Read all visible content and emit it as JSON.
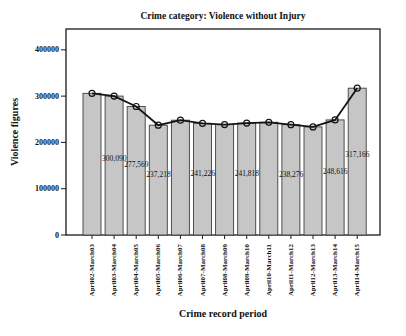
{
  "figure": {
    "title": "Crime category: Violence without Injury"
  },
  "chart_data": {
    "type": "bar",
    "overlay": "line",
    "title": "Crime category: Violence without Injury",
    "xlabel": "Crime record period",
    "ylabel": "Violence figures",
    "categories": [
      "April02-March03",
      "April03-March04",
      "April04-March05",
      "April05-March06",
      "April06-March07",
      "April07-March08",
      "April08-March09",
      "April09-March10",
      "April10-March11",
      "April11-March12",
      "April12-March13",
      "April13-March14",
      "April14-March15"
    ],
    "values": [
      306000,
      300090,
      277569,
      237218,
      248000,
      241226,
      238500,
      241818,
      243500,
      238276,
      233500,
      248616,
      317166
    ],
    "value_labels": [
      "",
      "300,090",
      "277,569",
      "237,218",
      "",
      "241,226",
      "",
      "241,818",
      "",
      "238,276",
      "",
      "248,616",
      "317,166"
    ],
    "y_ticks": [
      "0",
      "100000",
      "200000",
      "300000",
      "400000"
    ],
    "y_tick_values": [
      0,
      100000,
      200000,
      300000,
      400000
    ],
    "ylim": [
      0,
      445000
    ],
    "grid": false,
    "legend": "none",
    "colors": {
      "bar_fill": "#c6c6c6",
      "bar_border": "#3f3f3f",
      "line": "#141414",
      "marker_stroke": "#141414",
      "frame": "#1a1a1a",
      "text": "#111111"
    },
    "marker": "open-circle"
  }
}
